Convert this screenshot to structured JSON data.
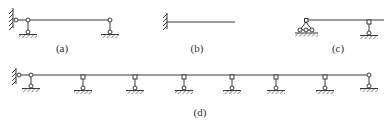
{
  "figure": {
    "stroke_color": "#3a3a3a",
    "panels": [
      {
        "id": "a",
        "label": "(a)",
        "label_pos": [
          62,
          50
        ]
      },
      {
        "id": "b",
        "label": "(b)",
        "label_pos": [
          197,
          50
        ]
      },
      {
        "id": "c",
        "label": "(c)",
        "label_pos": [
          338,
          50
        ]
      },
      {
        "id": "d",
        "label": "(d)",
        "label_pos": [
          200,
          114
        ]
      }
    ]
  }
}
